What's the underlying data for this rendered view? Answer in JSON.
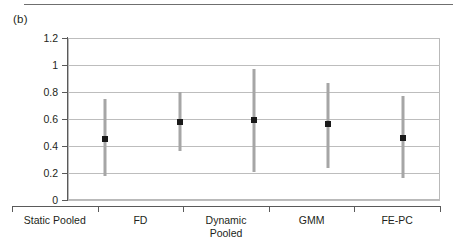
{
  "figure": {
    "panel_label": "(b)"
  },
  "chart_data": {
    "type": "scatter",
    "title": "",
    "subtitle": "",
    "xlabel": "",
    "ylabel": "",
    "categories": [
      "Static Pooled",
      "FD",
      "Dynamic Pooled",
      "GMM",
      "FE-PC"
    ],
    "category_lines": [
      [
        "Static Pooled"
      ],
      [
        "FD"
      ],
      [
        "Dynamic",
        "Pooled"
      ],
      [
        "GMM"
      ],
      [
        "FE-PC"
      ]
    ],
    "values": [
      0.45,
      0.58,
      0.59,
      0.56,
      0.46
    ],
    "lower": [
      0.18,
      0.36,
      0.21,
      0.24,
      0.16
    ],
    "upper": [
      0.75,
      0.8,
      0.97,
      0.87,
      0.77
    ],
    "ylim": [
      0,
      1.2
    ],
    "yticks": [
      0,
      0.2,
      0.4,
      0.6,
      0.8,
      1,
      1.2
    ],
    "ytick_labels": [
      "0",
      "0.2",
      "0.4",
      "0.6",
      "0.8",
      "1",
      "1.2"
    ],
    "grid": true,
    "grid_axis": "y",
    "legend": "none",
    "series": [
      {
        "name": "point estimate",
        "values": [
          0.45,
          0.58,
          0.59,
          0.56,
          0.46
        ]
      },
      {
        "name": "interval",
        "lower": [
          0.18,
          0.36,
          0.21,
          0.24,
          0.16
        ],
        "upper": [
          0.75,
          0.8,
          0.97,
          0.87,
          0.77
        ]
      }
    ],
    "colors": {
      "point": "#1a1a1a",
      "interval": "#a6a6a6",
      "grid": "#bdbdbd",
      "axis": "#5a5a5a"
    }
  }
}
